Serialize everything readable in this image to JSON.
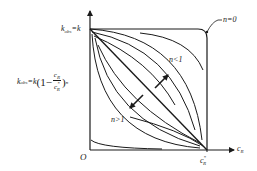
{
  "diagram": {
    "type": "reaction-rate-curves",
    "colors": {
      "stroke": "#1a1a1a",
      "background": "#ffffff"
    },
    "axes": {
      "origin_label": "O",
      "x_axis_label": {
        "base": "c",
        "sub": "R"
      },
      "x_tick_label": {
        "base": "c",
        "sup": "*",
        "sub": "R"
      },
      "y_top_label": {
        "lhs": "k",
        "lhs_sub": "obs",
        "rhs": "=k"
      },
      "y_mid_label": {
        "lhs": "k",
        "lhs_sub": "obs",
        "rhs": "=k",
        "open": "(1−",
        "num": "c",
        "num_sub": "R",
        "den": "c",
        "den_sup": "*",
        "den_sub": "R",
        "close": ")",
        "exp": "n"
      }
    },
    "annotations": {
      "n_zero": "n=0",
      "n_less_one": "n<1",
      "n_greater_one": "n>1"
    },
    "curves": {
      "n_less_one_count": 3,
      "n_greater_one_count": 3,
      "n_equal_one": "straight diagonal",
      "n_equal_zero": "horizontal line then vertical drop"
    }
  }
}
